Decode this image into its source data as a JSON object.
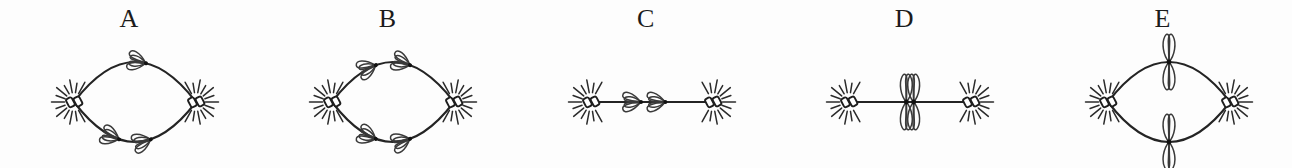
{
  "figure": {
    "background_color": "#fdfdfd",
    "ink_color": "#242424",
    "width": 1292,
    "height": 168
  },
  "panels": [
    {
      "id": "panel-a",
      "label": "A",
      "spindle_shape": "lens",
      "description": "Two centrosomes with asters joined by two curved spindle fibers; one chromosome on the upper fiber and two chromosomes on the lower fiber.",
      "pole_left_label": "centrosome",
      "pole_right_label": "centrosome",
      "chromosome_count": 3,
      "chromosomes": [
        {
          "fiber": "upper",
          "position": 0.58,
          "direction": "right"
        },
        {
          "fiber": "lower",
          "position": 0.36,
          "direction": "left"
        },
        {
          "fiber": "lower",
          "position": 0.62,
          "direction": "right"
        }
      ]
    },
    {
      "id": "panel-b",
      "label": "B",
      "spindle_shape": "lens",
      "description": "Two centrosomes with asters joined by two curved spindle fibers; each fiber carries two chromosomes moving apart toward opposite poles.",
      "pole_left_label": "centrosome",
      "pole_right_label": "centrosome",
      "chromosome_count": 4,
      "chromosomes": [
        {
          "fiber": "upper",
          "position": 0.35,
          "direction": "left"
        },
        {
          "fiber": "upper",
          "position": 0.63,
          "direction": "right"
        },
        {
          "fiber": "lower",
          "position": 0.35,
          "direction": "left"
        },
        {
          "fiber": "lower",
          "position": 0.63,
          "direction": "right"
        }
      ]
    },
    {
      "id": "panel-c",
      "label": "C",
      "spindle_shape": "line",
      "description": "Two centrosomes with asters joined by a single straight spindle fiber carrying two chromosomes that point away from one another.",
      "pole_left_label": "centrosome",
      "pole_right_label": "centrosome",
      "chromosome_count": 2,
      "chromosomes": [
        {
          "fiber": "middle",
          "position": 0.4,
          "direction": "left"
        },
        {
          "fiber": "middle",
          "position": 0.6,
          "direction": "right"
        }
      ]
    },
    {
      "id": "panel-d",
      "label": "D",
      "spindle_shape": "line",
      "description": "Two centrosomes with asters joined by a single straight spindle fiber; two X-shaped chromosomes are aligned vertically at the centre of the fiber.",
      "pole_left_label": "centrosome",
      "pole_right_label": "centrosome",
      "chromosome_count": 2,
      "chromosomes": [
        {
          "fiber": "middle",
          "position": 0.47,
          "direction": "vertical"
        },
        {
          "fiber": "middle",
          "position": 0.53,
          "direction": "vertical"
        }
      ]
    },
    {
      "id": "panel-e",
      "label": "E",
      "spindle_shape": "lens",
      "description": "Two centrosomes with asters joined by two curved spindle fibers; one vertical X-shaped chromosome straddles the midpoint of each fiber.",
      "pole_left_label": "centrosome",
      "pole_right_label": "centrosome",
      "chromosome_count": 2,
      "chromosomes": [
        {
          "fiber": "upper",
          "position": 0.5,
          "direction": "vertical"
        },
        {
          "fiber": "lower",
          "position": 0.5,
          "direction": "vertical"
        }
      ]
    }
  ]
}
